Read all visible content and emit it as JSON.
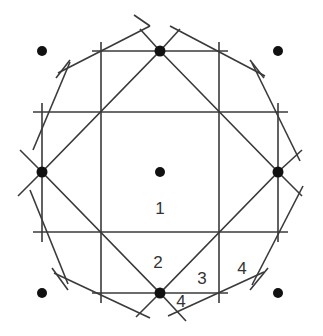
{
  "diagram": {
    "colors": {
      "line": "#3a3a3a",
      "dot": "#111111",
      "label": "#333333",
      "background": "#ffffff"
    },
    "dots": [
      {
        "name": "corner-top-left",
        "x": 42,
        "y": 51
      },
      {
        "name": "top",
        "x": 160,
        "y": 51
      },
      {
        "name": "corner-top-right",
        "x": 278,
        "y": 51
      },
      {
        "name": "left",
        "x": 42,
        "y": 172
      },
      {
        "name": "center",
        "x": 160,
        "y": 172
      },
      {
        "name": "right",
        "x": 278,
        "y": 172
      },
      {
        "name": "corner-bottom-left",
        "x": 42,
        "y": 293
      },
      {
        "name": "bottom",
        "x": 160,
        "y": 293
      },
      {
        "name": "corner-bottom-right",
        "x": 278,
        "y": 293
      }
    ],
    "labels": [
      {
        "text": "1",
        "x": 160,
        "y": 214
      },
      {
        "text": "2",
        "x": 158,
        "y": 268
      },
      {
        "text": "3",
        "x": 202,
        "y": 284
      },
      {
        "text": "4",
        "x": 242,
        "y": 274
      },
      {
        "text": "4",
        "x": 181,
        "y": 307
      }
    ]
  }
}
